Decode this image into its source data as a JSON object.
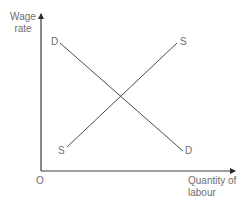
{
  "diagram": {
    "type": "supply-demand-labour-market",
    "y_axis_label_line1": "Wage",
    "y_axis_label_line2": "rate",
    "x_axis_label_line1": "Quantity of",
    "x_axis_label_line2": "labour",
    "origin_label": "O",
    "demand_curve": {
      "label_start": "D",
      "label_end": "D",
      "slope": "downward"
    },
    "supply_curve": {
      "label_start": "S",
      "label_end": "S",
      "slope": "upward"
    },
    "colors": {
      "axis": "#3a3a3a",
      "curve": "#4a4a4a",
      "label": "#6e6e6e"
    }
  }
}
